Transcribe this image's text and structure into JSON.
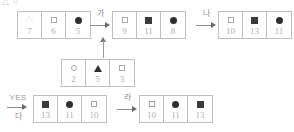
{
  "diagram": {
    "stray_marks": [
      {
        "glyph": "△",
        "x": 2,
        "y": -3
      },
      {
        "glyph": "○",
        "x": 13,
        "y": -3
      }
    ],
    "groups": [
      {
        "id": "group-top-left",
        "x": 17,
        "y": 11,
        "cells": [
          {
            "shape": "triangle-outline-icon",
            "value": "7"
          },
          {
            "shape": "square-outline-icon",
            "value": "6"
          },
          {
            "shape": "circle-filled-icon",
            "value": "5"
          }
        ]
      },
      {
        "id": "group-top-middle",
        "x": 112,
        "y": 11,
        "cells": [
          {
            "shape": "square-outline-icon",
            "value": "9"
          },
          {
            "shape": "square-filled-icon",
            "value": "11"
          },
          {
            "shape": "circle-filled-icon",
            "value": "8"
          }
        ]
      },
      {
        "id": "group-top-right",
        "x": 218,
        "y": 11,
        "cells": [
          {
            "shape": "square-outline-icon",
            "value": "10"
          },
          {
            "shape": "square-filled-icon",
            "value": "13"
          },
          {
            "shape": "circle-filled-icon",
            "value": "11"
          }
        ]
      },
      {
        "id": "group-middle",
        "x": 61,
        "y": 59,
        "cells": [
          {
            "shape": "circle-outline-icon",
            "value": "2"
          },
          {
            "shape": "triangle-filled-icon",
            "value": "5"
          },
          {
            "shape": "square-outline-icon",
            "value": "3"
          }
        ]
      },
      {
        "id": "group-bottom-left",
        "x": 33,
        "y": 95,
        "cells": [
          {
            "shape": "square-filled-icon",
            "value": "13"
          },
          {
            "shape": "circle-filled-icon",
            "value": "11"
          },
          {
            "shape": "square-outline-icon",
            "value": "10"
          }
        ]
      },
      {
        "id": "group-bottom-right",
        "x": 139,
        "y": 95,
        "cells": [
          {
            "shape": "square-outline-icon",
            "value": "10"
          },
          {
            "shape": "circle-filled-icon",
            "value": "11"
          },
          {
            "shape": "square-filled-icon",
            "value": "13"
          }
        ]
      }
    ],
    "arrows": [
      {
        "id": "arrow-ga",
        "label": "가",
        "x": 89,
        "y": 11
      },
      {
        "id": "arrow-na",
        "label": "나",
        "x": 195,
        "y": 11
      },
      {
        "id": "arrow-ra",
        "label": "라",
        "x": 116,
        "y": 95
      }
    ],
    "yes_arrow": {
      "id": "arrow-da",
      "top_label": "YES",
      "bottom_label": "다",
      "x": 5,
      "y": 93
    },
    "up_arrow": {
      "id": "arrow-up",
      "x": 99,
      "y": 37
    }
  }
}
